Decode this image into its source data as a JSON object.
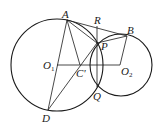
{
  "diagram": {
    "type": "geometry",
    "circles": [
      {
        "name": "O1",
        "cx": 57,
        "cy": 65,
        "r": 46
      },
      {
        "name": "O2",
        "cx": 121,
        "cy": 65,
        "r": 31
      }
    ],
    "points": {
      "A": {
        "x": 67,
        "y": 20,
        "label": "A"
      },
      "R": {
        "x": 97,
        "y": 26,
        "label": "R"
      },
      "B": {
        "x": 127,
        "y": 36,
        "label": "B"
      },
      "P": {
        "x": 97,
        "y": 43,
        "label": "P"
      },
      "O1": {
        "x": 57,
        "y": 65,
        "label": "O",
        "sub": "1"
      },
      "C": {
        "x": 80,
        "y": 65,
        "label": "C'"
      },
      "O2": {
        "x": 120,
        "y": 65,
        "label": "O",
        "sub": "2"
      },
      "Q": {
        "x": 97,
        "y": 87,
        "label": "Q"
      },
      "D": {
        "x": 48,
        "y": 110,
        "label": "D"
      }
    },
    "segments": [
      "AB",
      "AP",
      "AD",
      "AC'",
      "RQ",
      "PB",
      "BO2",
      "O1O2",
      "DP",
      "O1D"
    ]
  }
}
